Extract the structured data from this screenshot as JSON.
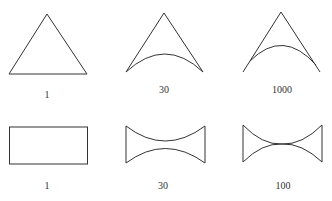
{
  "figure": {
    "rows": [
      {
        "shape_type": "triangle",
        "panels": [
          {
            "label": "1"
          },
          {
            "label": "30"
          },
          {
            "label": "1000"
          }
        ]
      },
      {
        "shape_type": "rectangle",
        "panels": [
          {
            "label": "1"
          },
          {
            "label": "30"
          },
          {
            "label": "100"
          }
        ]
      }
    ],
    "colors": {
      "stroke": "#333333",
      "background": "#ffffff"
    }
  }
}
